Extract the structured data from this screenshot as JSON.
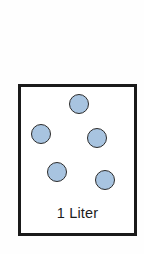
{
  "figure": {
    "background_color": "#fefefe"
  },
  "container": {
    "label": "1 Liter",
    "volume_value": "1",
    "volume_unit": "Liter",
    "border_color": "#1a1a1a",
    "fill_color": "#ffffff",
    "border_width_px": 3,
    "x": 18,
    "y": 84,
    "width": 119,
    "height": 152
  },
  "particles": {
    "count": 5,
    "fill_color": "#a8c4e0",
    "outline_color": "#2b2b2b",
    "radius_px": 10,
    "items": [
      {
        "id": "particle-1",
        "cx": 79,
        "cy": 104,
        "r": 10
      },
      {
        "id": "particle-2",
        "cx": 41,
        "cy": 134,
        "r": 10
      },
      {
        "id": "particle-3",
        "cx": 97,
        "cy": 138,
        "r": 10
      },
      {
        "id": "particle-4",
        "cx": 57,
        "cy": 172,
        "r": 10
      },
      {
        "id": "particle-5",
        "cx": 105,
        "cy": 180,
        "r": 10
      }
    ]
  }
}
